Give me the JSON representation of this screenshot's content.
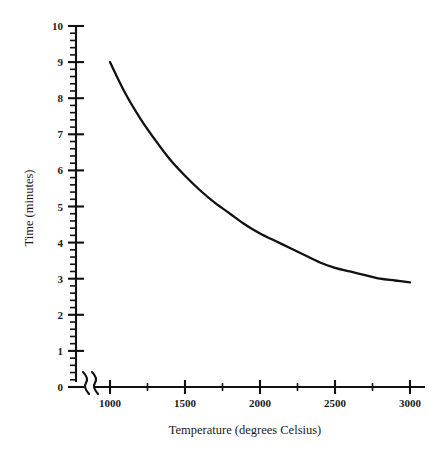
{
  "chart_data": {
    "type": "line",
    "title": "",
    "xlabel": "Temperature (degrees Celsius)",
    "ylabel": "Time (minutes)",
    "xlim": [
      900,
      3050
    ],
    "ylim": [
      0,
      10
    ],
    "grid": false,
    "legend": null,
    "axis_break": {
      "axis": "x",
      "symbol": "//",
      "note": "broken x-axis between origin and 1000"
    },
    "x_major_ticks": [
      1000,
      1500,
      2000,
      2500,
      3000
    ],
    "x_major_tick_labels": [
      "1000",
      "1500",
      "2000",
      "2500",
      "3000"
    ],
    "x_minor_ticks": [
      1250,
      1750,
      2250,
      2750
    ],
    "y_major_ticks": [
      0,
      1,
      2,
      3,
      4,
      5,
      6,
      7,
      8,
      9,
      10
    ],
    "y_major_tick_labels": [
      "0",
      "1",
      "2",
      "3",
      "4",
      "5",
      "6",
      "7",
      "8",
      "9",
      "10"
    ],
    "y_minor_tick_step": 0.2,
    "series": [
      {
        "name": "time-vs-temperature",
        "color": "#111111",
        "x": [
          1000,
          1100,
          1200,
          1300,
          1400,
          1500,
          1600,
          1700,
          1800,
          1900,
          2000,
          2100,
          2200,
          2300,
          2400,
          2500,
          2600,
          2700,
          2800,
          2900,
          3000
        ],
        "y": [
          9.0,
          8.15,
          7.45,
          6.85,
          6.3,
          5.85,
          5.45,
          5.1,
          4.8,
          4.5,
          4.25,
          4.05,
          3.85,
          3.65,
          3.45,
          3.3,
          3.2,
          3.1,
          3.0,
          2.95,
          2.9
        ]
      }
    ]
  },
  "labels": {
    "x_axis_title": "Temperature (degrees Celsius)",
    "y_axis_title": "Time (minutes)",
    "x_ticks": [
      "1000",
      "1500",
      "2000",
      "2500",
      "3000"
    ],
    "y_ticks": [
      "0",
      "1",
      "2",
      "3",
      "4",
      "5",
      "6",
      "7",
      "8",
      "9",
      "10"
    ]
  },
  "colors": {
    "background": "#ffffff",
    "axis": "#111111",
    "curve": "#111111",
    "text": "#1a1a1a"
  }
}
